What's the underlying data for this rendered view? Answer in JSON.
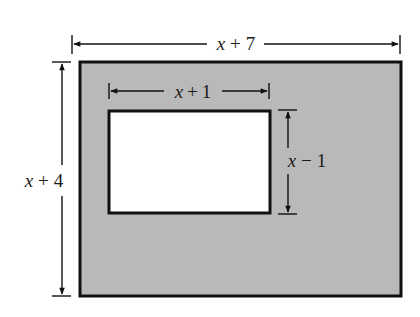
{
  "diagram": {
    "outer_rectangle": {
      "fill": "#b8b8b8",
      "stroke": "#111111",
      "width_label": {
        "var": "x",
        "op": "+",
        "num": "7"
      },
      "height_label": {
        "var": "x",
        "op": "+",
        "num": "4"
      }
    },
    "inner_rectangle": {
      "fill": "#ffffff",
      "stroke": "#111111",
      "width_label": {
        "var": "x",
        "op": "+",
        "num": "1"
      },
      "height_label": {
        "var": "x",
        "op": "−",
        "num": "1"
      }
    }
  }
}
